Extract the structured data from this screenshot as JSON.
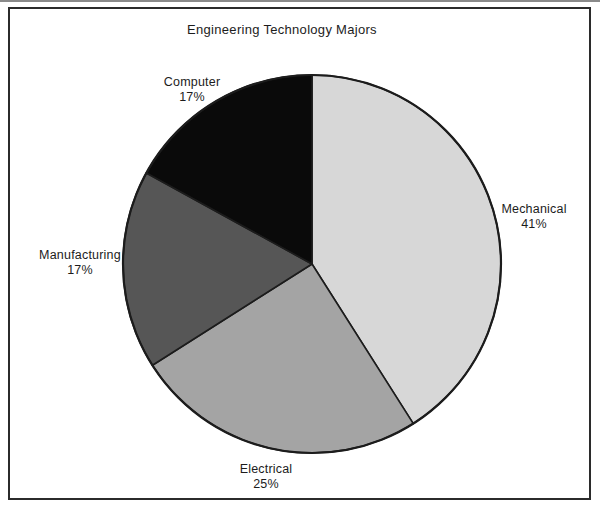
{
  "chart_data": {
    "type": "pie",
    "title": "Engineering Technology Majors",
    "slices": [
      {
        "label": "Mechanical",
        "value": 41,
        "pct_label": "41%",
        "color": "#d7d7d7"
      },
      {
        "label": "Electrical",
        "value": 25,
        "pct_label": "25%",
        "color": "#a4a4a4"
      },
      {
        "label": "Manufacturing",
        "value": 17,
        "pct_label": "17%",
        "color": "#565656"
      },
      {
        "label": "Computer",
        "value": 17,
        "pct_label": "17%",
        "color": "#0a0a0a"
      }
    ],
    "start_angle_deg": 0,
    "direction": "clockwise",
    "labels_position": "outside",
    "legend": "none",
    "outline_color": "#1c1c1c",
    "text_color": "#1c1c1c",
    "background": "#ffffff",
    "frame_border_color": "#2b2b2b"
  }
}
